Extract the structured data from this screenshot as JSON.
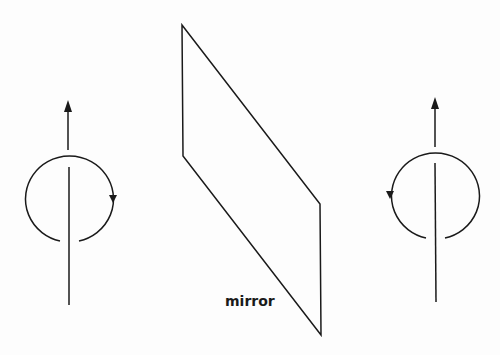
{
  "diagram": {
    "title": "",
    "mirror_label": "mirror",
    "stroke_color": "#1a1a1a",
    "nodes": [
      {
        "id": "left-spin",
        "type": "rotation-axis",
        "arrow_direction": "up",
        "rotation": "clockwise-as-viewed-from-front"
      },
      {
        "id": "mirror",
        "type": "plane",
        "label": "mirror"
      },
      {
        "id": "right-spin",
        "type": "rotation-axis",
        "arrow_direction": "up",
        "rotation": "counterclockwise-as-viewed-from-front"
      }
    ]
  }
}
